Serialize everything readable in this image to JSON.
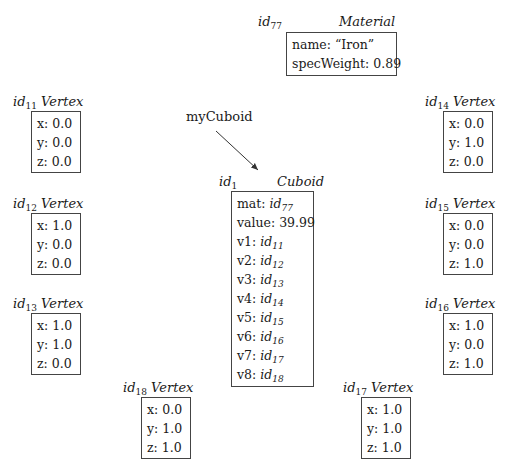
{
  "variable": {
    "name": "myCuboid",
    "points_to": "id1"
  },
  "material": {
    "id": "id",
    "id_sub": "77",
    "class": "Material",
    "fields": [
      {
        "label": "name:",
        "value": "“Iron”"
      },
      {
        "label": "specWeight:",
        "value": "0.89"
      }
    ]
  },
  "cuboid": {
    "id": "id",
    "id_sub": "1",
    "class": "Cuboid",
    "fields": [
      {
        "label": "mat:",
        "ref": "id",
        "ref_sub": "77"
      },
      {
        "label": "value:",
        "value": "39.99"
      },
      {
        "label": "v1:",
        "ref": "id",
        "ref_sub": "11"
      },
      {
        "label": "v2:",
        "ref": "id",
        "ref_sub": "12"
      },
      {
        "label": "v3:",
        "ref": "id",
        "ref_sub": "13"
      },
      {
        "label": "v4:",
        "ref": "id",
        "ref_sub": "14"
      },
      {
        "label": "v5:",
        "ref": "id",
        "ref_sub": "15"
      },
      {
        "label": "v6:",
        "ref": "id",
        "ref_sub": "16"
      },
      {
        "label": "v7:",
        "ref": "id",
        "ref_sub": "17"
      },
      {
        "label": "v8:",
        "ref": "id",
        "ref_sub": "18"
      }
    ]
  },
  "vertices": [
    {
      "id": "id",
      "id_sub": "11",
      "class": "Vertex",
      "x": "x: 0.0",
      "y": "y: 0.0",
      "z": "z: 0.0"
    },
    {
      "id": "id",
      "id_sub": "12",
      "class": "Vertex",
      "x": "x: 1.0",
      "y": "y: 0.0",
      "z": "z: 0.0"
    },
    {
      "id": "id",
      "id_sub": "13",
      "class": "Vertex",
      "x": "x: 1.0",
      "y": "y: 1.0",
      "z": "z: 0.0"
    },
    {
      "id": "id",
      "id_sub": "14",
      "class": "Vertex",
      "x": "x: 0.0",
      "y": "y: 1.0",
      "z": "z: 0.0"
    },
    {
      "id": "id",
      "id_sub": "15",
      "class": "Vertex",
      "x": "x: 0.0",
      "y": "y: 0.0",
      "z": "z: 1.0"
    },
    {
      "id": "id",
      "id_sub": "16",
      "class": "Vertex",
      "x": "x: 1.0",
      "y": "y: 0.0",
      "z": "z: 1.0"
    },
    {
      "id": "id",
      "id_sub": "17",
      "class": "Vertex",
      "x": "x: 1.0",
      "y": "y: 1.0",
      "z": "z: 1.0"
    },
    {
      "id": "id",
      "id_sub": "18",
      "class": "Vertex",
      "x": "x: 0.0",
      "y": "y: 1.0",
      "z": "z: 1.0"
    }
  ]
}
